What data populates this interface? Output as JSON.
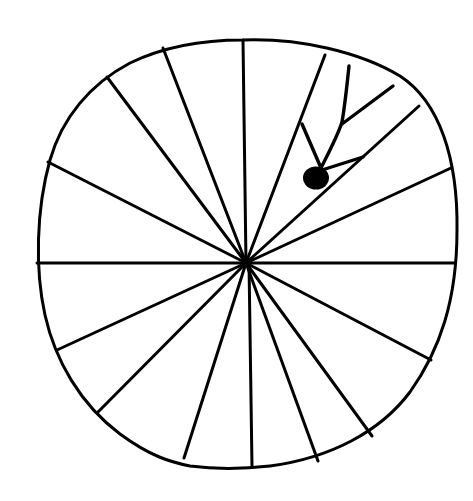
{
  "illustration": {
    "subject": "hand-drawn wheel divided into wedge segments by spokes, with a small stick-like figure (filled dot with branching lines) in the upper-right segments",
    "ink_color": "#000000",
    "background_color": "#ffffff",
    "spoke_count": 16,
    "has_dot_figure": true
  }
}
